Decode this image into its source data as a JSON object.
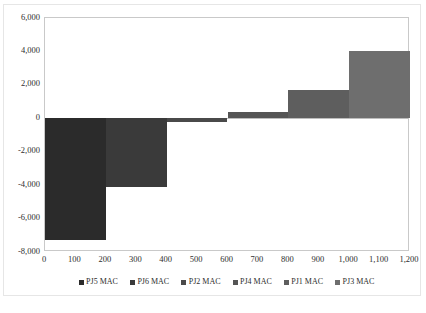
{
  "chart_data": {
    "type": "bar",
    "title": "",
    "subtitle": "",
    "xlabel": "",
    "ylabel": "",
    "xlim": [
      0,
      1200
    ],
    "ylim": [
      -8000,
      6000
    ],
    "grid": false,
    "legend_position": "bottom",
    "x_ticks": [
      "0",
      "100",
      "200",
      "300",
      "400",
      "500",
      "600",
      "700",
      "800",
      "900",
      "1,000",
      "1,100",
      "1,200"
    ],
    "x_tick_values": [
      0,
      100,
      200,
      300,
      400,
      500,
      600,
      700,
      800,
      900,
      1000,
      1100,
      1200
    ],
    "y_ticks": [
      "6,000",
      "4,000",
      "2,000",
      "0",
      "-2,000",
      "-4,000",
      "-6,000",
      "-8,000"
    ],
    "y_tick_values": [
      6000,
      4000,
      2000,
      0,
      -2000,
      -4000,
      -6000,
      -8000
    ],
    "categories": [
      "PJ5 MAC",
      "PJ6 MAC",
      "PJ2 MAC",
      "PJ4 MAC",
      "PJ1 MAC",
      "PJ3 MAC"
    ],
    "values": [
      -7300,
      -4100,
      -250,
      400,
      1700,
      4050
    ],
    "bars": [
      {
        "name": "PJ5 MAC",
        "x_start": 0,
        "x_end": 200,
        "value": -7300,
        "color": "#2b2b2b"
      },
      {
        "name": "PJ6 MAC",
        "x_start": 200,
        "x_end": 400,
        "value": -4100,
        "color": "#3a3a3a"
      },
      {
        "name": "PJ2 MAC",
        "x_start": 400,
        "x_end": 600,
        "value": -250,
        "color": "#4a4a4a"
      },
      {
        "name": "PJ4 MAC",
        "x_start": 600,
        "x_end": 800,
        "value": 400,
        "color": "#555555"
      },
      {
        "name": "PJ1 MAC",
        "x_start": 800,
        "x_end": 1000,
        "value": 1700,
        "color": "#5e5e5e"
      },
      {
        "name": "PJ3 MAC",
        "x_start": 1000,
        "x_end": 1200,
        "value": 4050,
        "color": "#6e6e6e"
      }
    ],
    "legend": [
      {
        "label": "PJ5 MAC",
        "color": "#2b2b2b"
      },
      {
        "label": "PJ6 MAC",
        "color": "#3a3a3a"
      },
      {
        "label": "PJ2 MAC",
        "color": "#4a4a4a"
      },
      {
        "label": "PJ4 MAC",
        "color": "#555555"
      },
      {
        "label": "PJ1 MAC",
        "color": "#5e5e5e"
      },
      {
        "label": "PJ3 MAC",
        "color": "#6e6e6e"
      }
    ]
  },
  "caption": {
    "text": ""
  }
}
